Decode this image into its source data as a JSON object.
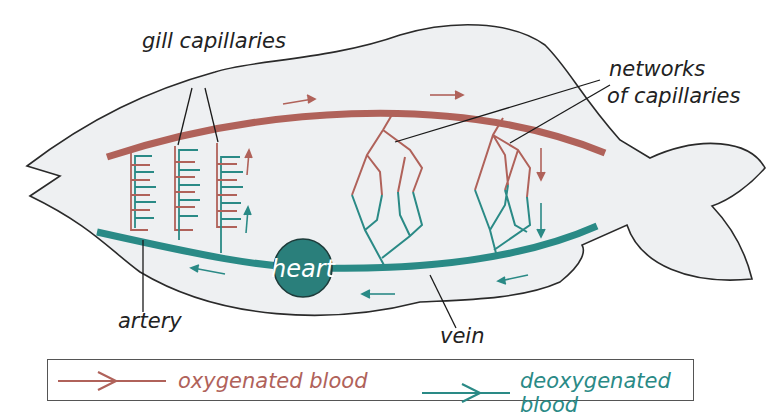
{
  "diagram": {
    "labels": {
      "gill_capillaries": "gill capillaries",
      "networks_line1": "networks",
      "networks_line2": "of capillaries",
      "artery": "artery",
      "vein": "vein",
      "heart": "heart"
    },
    "legend": [
      {
        "label": "oxygenated blood",
        "color": "#b0625a"
      },
      {
        "label": "deoxygenated blood",
        "color": "#2a8a86"
      }
    ],
    "colors": {
      "oxygenated": "#b0625a",
      "deoxygenated": "#2a8a86",
      "heart_fill": "#2a7f7b",
      "body_fill": "#eef0f2",
      "outline": "#2a2a2a"
    }
  }
}
